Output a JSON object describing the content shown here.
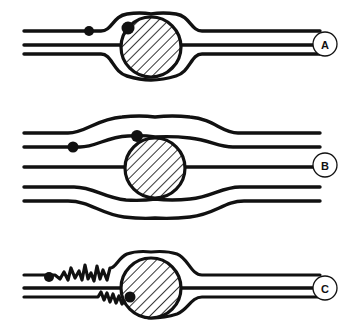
{
  "figure": {
    "title": "",
    "background_color": "#ffffff",
    "stroke_color": "#111111",
    "fill_color": "#111111",
    "width": 348,
    "height": 333,
    "panel_count": 3
  },
  "panels": [
    {
      "id": "panel-a",
      "label": "A",
      "label_cx": 325,
      "label_cy": 44,
      "label_r": 12,
      "description": "Flow lines deflected narrowly around a hatched circular obstacle",
      "obstacle": {
        "name": "hatched-circle",
        "cx": 151,
        "cy": 47,
        "r": 31,
        "hatch_angle_deg": 45,
        "hatch_spacing": 7
      },
      "marker_dots": [
        {
          "name": "upstream-dot",
          "cx": 89,
          "cy": 31,
          "r": 5
        },
        {
          "name": "contact-dot",
          "cx": 128,
          "cy": 28,
          "r": 6
        }
      ],
      "streamline_count": 3
    },
    {
      "id": "panel-b",
      "label": "B",
      "label_cx": 325,
      "label_cy": 165,
      "label_r": 12,
      "description": "Flow lines deflected broadly and smoothly around a hatched circular obstacle",
      "obstacle": {
        "name": "hatched-circle",
        "cx": 155,
        "cy": 168,
        "r": 31,
        "hatch_angle_deg": 45,
        "hatch_spacing": 7
      },
      "marker_dots": [
        {
          "name": "upstream-dot",
          "cx": 73,
          "cy": 147,
          "r": 5
        },
        {
          "name": "contact-dot",
          "cx": 137,
          "cy": 135,
          "r": 6
        }
      ],
      "streamline_count": 5
    },
    {
      "id": "panel-c",
      "label": "C",
      "label_cx": 325,
      "label_cy": 288,
      "label_r": 12,
      "description": "Turbulent jagged flow line approaching a hatched circular obstacle",
      "obstacle": {
        "name": "hatched-circle",
        "cx": 151,
        "cy": 288,
        "r": 31,
        "hatch_angle_deg": 45,
        "hatch_spacing": 7
      },
      "marker_dots": [
        {
          "name": "upstream-dot",
          "cx": 49,
          "cy": 278,
          "r": 5
        },
        {
          "name": "contact-dot",
          "cx": 130,
          "cy": 297,
          "r": 5
        }
      ],
      "streamline_count": 3,
      "turbulence": true
    }
  ]
}
